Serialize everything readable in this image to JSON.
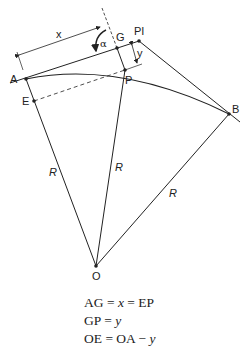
{
  "diagram": {
    "type": "circular-curve-offset-geometry",
    "points": {
      "A": "A",
      "G": "G",
      "PI": "PI",
      "P": "P",
      "E": "E",
      "B": "B",
      "O": "O"
    },
    "dimension_labels": {
      "x": "x",
      "y": "y",
      "alpha": "α"
    },
    "radius_labels": [
      "R",
      "R",
      "R"
    ],
    "colors": {
      "line": "#222222",
      "background": "#ffffff"
    }
  },
  "equations": [
    {
      "lhs": "AG",
      "mid": " = ",
      "var": "x",
      "rhs": " = EP"
    },
    {
      "lhs": "GP",
      "mid": " = ",
      "var": "y",
      "rhs": ""
    },
    {
      "lhs": "OE",
      "mid": " = OA − ",
      "var": "y",
      "rhs": ""
    }
  ]
}
